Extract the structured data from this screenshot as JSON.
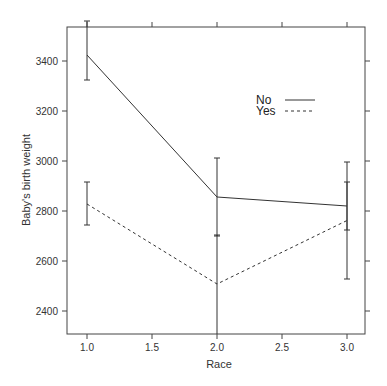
{
  "chart_data": {
    "type": "line",
    "title": "",
    "xlabel": "Race",
    "ylabel": "Baby's birth weight",
    "x": [
      1.0,
      2.0,
      3.0
    ],
    "xlim": [
      0.9,
      3.14
    ],
    "ylim": [
      2310,
      3540
    ],
    "xticks": [
      1.0,
      1.5,
      2.0,
      2.5,
      3.0
    ],
    "xtick_labels": [
      "1.0",
      "1.5",
      "2.0",
      "2.5",
      "3.0"
    ],
    "yticks": [
      2400,
      2600,
      2800,
      3000,
      3200,
      3400
    ],
    "ytick_labels": [
      "2400",
      "2600",
      "2800",
      "3000",
      "3200",
      "3400"
    ],
    "grid": false,
    "legend_position": "upper right (inside)",
    "series": [
      {
        "name": "No",
        "style": "solid",
        "values": [
          3424,
          2856,
          2820
        ],
        "error_lower": [
          3324,
          2700,
          2724
        ],
        "error_upper": [
          3560,
          3012,
          2916
        ]
      },
      {
        "name": "Yes",
        "style": "dashed",
        "values": [
          2828,
          2508,
          2762
        ],
        "error_lower": [
          2744,
          2290,
          2528
        ],
        "error_upper": [
          2916,
          2704,
          2996
        ]
      }
    ]
  },
  "legend": {
    "items": [
      {
        "label": "No",
        "style": "solid"
      },
      {
        "label": "Yes",
        "style": "dashed"
      }
    ]
  },
  "colors": {
    "line": "#333333",
    "axis": "#444444",
    "background": "#ffffff"
  }
}
